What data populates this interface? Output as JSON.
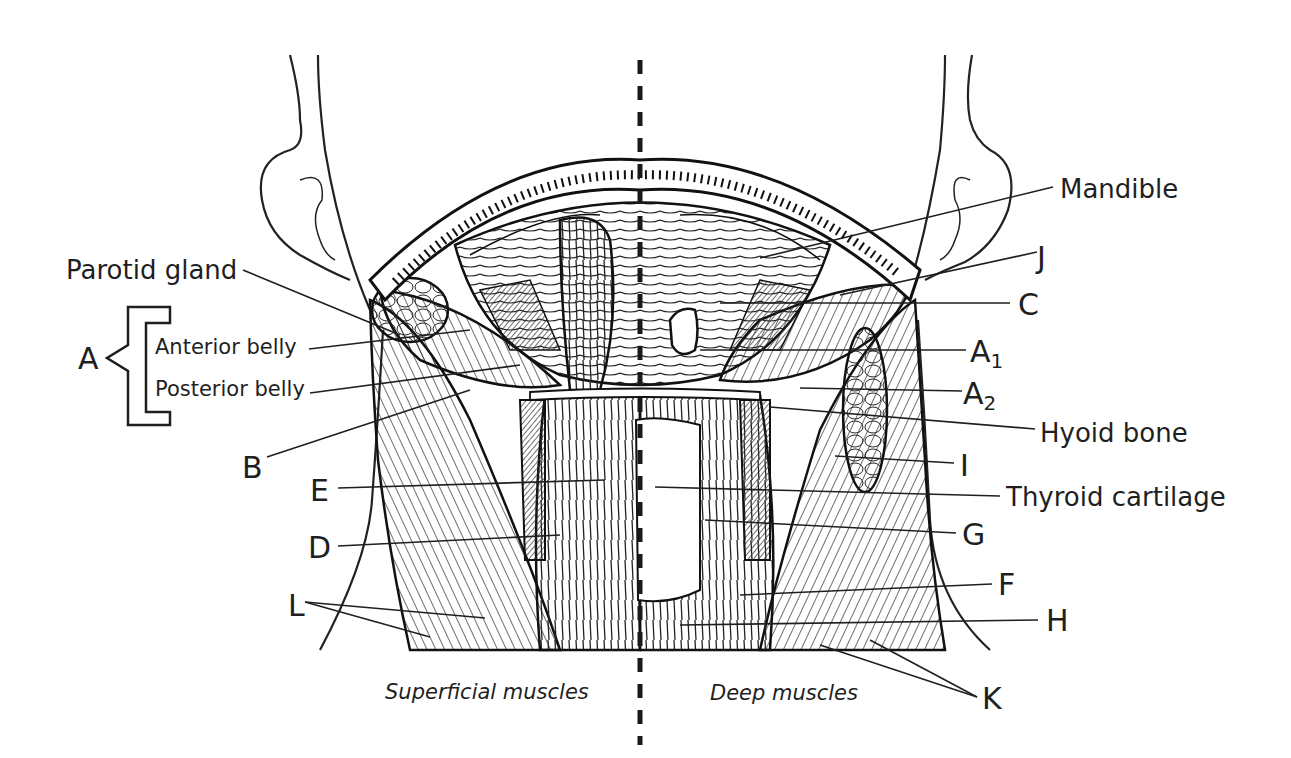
{
  "figure": {
    "divider": "dashed midline",
    "halves": {
      "left": "Superficial muscles",
      "right": "Deep muscles"
    }
  },
  "labels": {
    "mandible": "Mandible",
    "parotid_gland": "Parotid gland",
    "hyoid_bone": "Hyoid bone",
    "thyroid_cartilage": "Thyroid cartilage",
    "a_group": "A",
    "anterior_belly": "Anterior belly",
    "posterior_belly": "Posterior belly",
    "a1": "A",
    "a1_sub": "1",
    "a2": "A",
    "a2_sub": "2",
    "b": "B",
    "c": "C",
    "d": "D",
    "e": "E",
    "f": "F",
    "g": "G",
    "h": "H",
    "i": "I",
    "j": "J",
    "k": "K",
    "l": "L"
  },
  "colors": {
    "ink": "#1f1f1f",
    "background": "#ffffff",
    "shade": "#555555"
  }
}
